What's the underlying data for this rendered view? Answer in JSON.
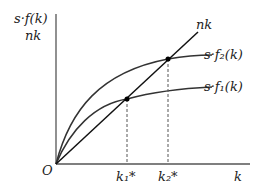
{
  "diagram": {
    "y_axis_label_line1": "s·f(k)",
    "y_axis_label_line2": "nk",
    "x_axis_label": "k",
    "origin_label": "O",
    "curves": [
      {
        "name": "nk",
        "label": "nk",
        "type": "line"
      },
      {
        "name": "s-f2",
        "label": "s·f₂(k)",
        "type": "concave"
      },
      {
        "name": "s-f1",
        "label": "s·f₁(k)",
        "type": "concave"
      }
    ],
    "steady_states": [
      {
        "label": "k₁*"
      },
      {
        "label": "k₂*"
      }
    ],
    "colors": {
      "curve": "#333333",
      "axis": "#444444",
      "line": "#111111"
    }
  }
}
